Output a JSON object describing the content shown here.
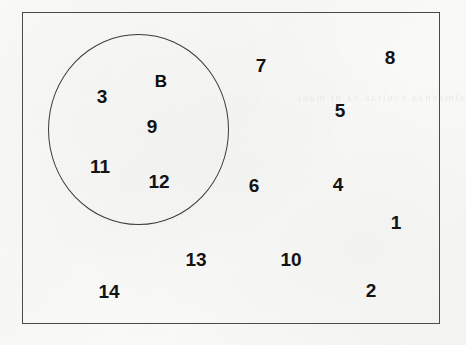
{
  "diagram": {
    "type": "venn",
    "title": "",
    "background_color": "#f8f8f7",
    "ink_color": "#131313",
    "border_color": "#4a4a4a",
    "bleed_through_text": "almeenaa  eoniiaa  oa ni  maoi"
  },
  "universal_set": {
    "name": "universal-set",
    "shape": "rectangle",
    "x": 22,
    "y": 12,
    "width": 418,
    "height": 312
  },
  "sets": [
    {
      "label": "B",
      "shape": "circle",
      "x": 48,
      "y": 34,
      "width": 181,
      "height": 191,
      "label_x": 161,
      "label_y": 81,
      "members": [
        3,
        9,
        11,
        12
      ]
    }
  ],
  "elements": [
    {
      "value": "3",
      "x": 102,
      "y": 96,
      "region": "inside-B"
    },
    {
      "value": "9",
      "x": 152,
      "y": 126,
      "region": "inside-B"
    },
    {
      "value": "11",
      "x": 100,
      "y": 166,
      "region": "inside-B"
    },
    {
      "value": "12",
      "x": 159,
      "y": 181,
      "region": "inside-B"
    },
    {
      "value": "7",
      "x": 261,
      "y": 65,
      "region": "outside-B"
    },
    {
      "value": "8",
      "x": 390,
      "y": 57,
      "region": "outside-B"
    },
    {
      "value": "5",
      "x": 340,
      "y": 110,
      "region": "outside-B"
    },
    {
      "value": "6",
      "x": 254,
      "y": 185,
      "region": "outside-B"
    },
    {
      "value": "4",
      "x": 338,
      "y": 184,
      "region": "outside-B"
    },
    {
      "value": "1",
      "x": 396,
      "y": 222,
      "region": "outside-B"
    },
    {
      "value": "13",
      "x": 196,
      "y": 259,
      "region": "outside-B"
    },
    {
      "value": "10",
      "x": 291,
      "y": 259,
      "region": "outside-B"
    },
    {
      "value": "14",
      "x": 109,
      "y": 291,
      "region": "outside-B"
    },
    {
      "value": "2",
      "x": 371,
      "y": 290,
      "region": "outside-B"
    }
  ]
}
